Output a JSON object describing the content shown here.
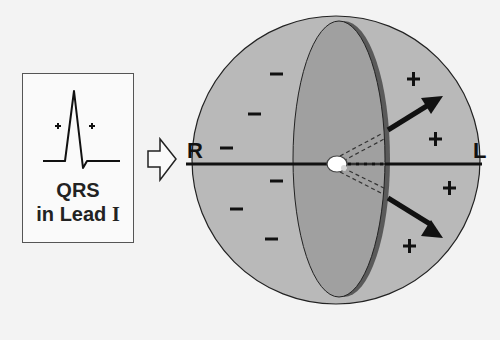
{
  "figure": {
    "left_panel": {
      "title_line1": "QRS",
      "title_line2_prefix": "in Lead ",
      "title_line2_numeral": "I",
      "waveform_signs": [
        "+",
        "+"
      ]
    },
    "arrow": "hollow-right-arrow",
    "sphere": {
      "left_label": "R",
      "right_label": "L",
      "negative_signs": [
        "−",
        "−",
        "−",
        "−",
        "−",
        "−"
      ],
      "positive_signs": [
        "+",
        "+",
        "+",
        "+"
      ]
    },
    "colors": {
      "background": "#f3f3f3",
      "sphere_fill": "#b9b9b9",
      "plane_fill": "#999999",
      "plane_rim": "#555555",
      "ink": "#111111"
    }
  }
}
